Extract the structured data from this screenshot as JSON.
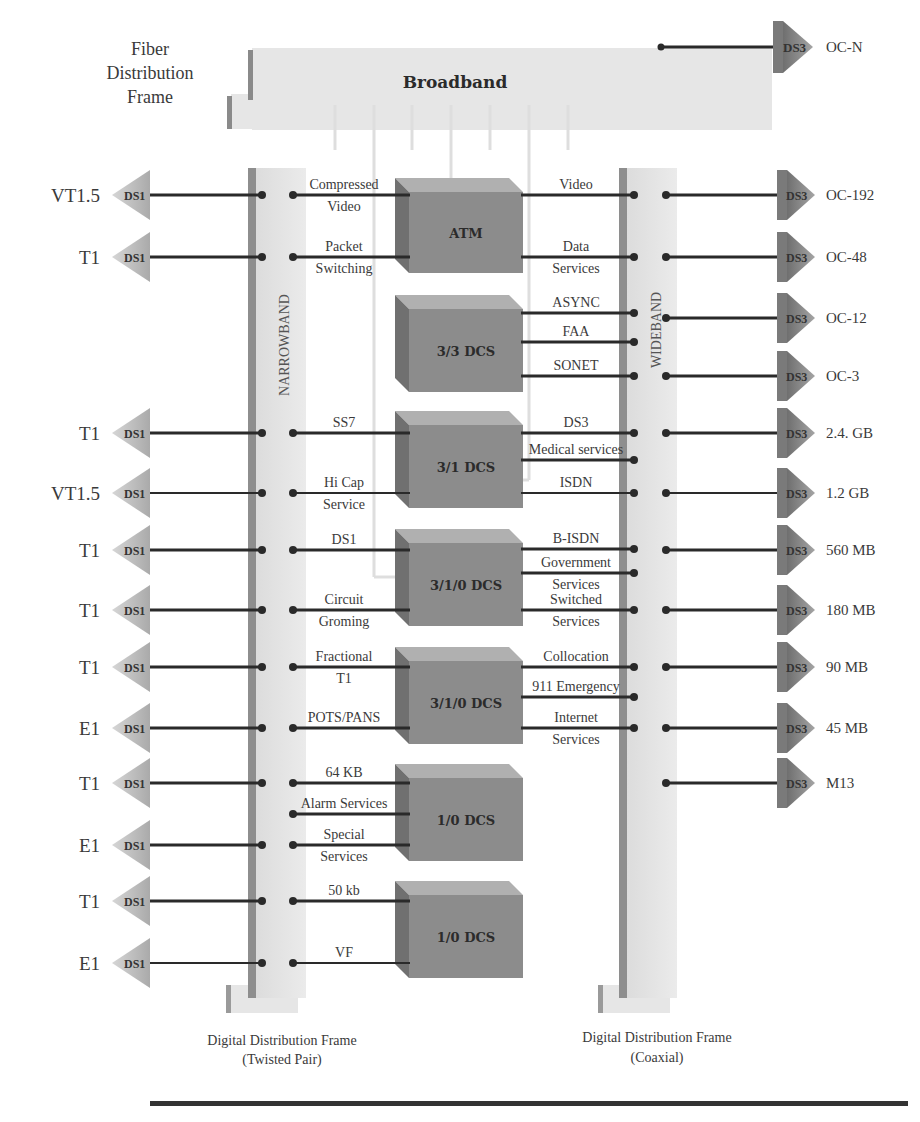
{
  "title_left": {
    "line1": "Fiber",
    "line2": "Distribution",
    "line3": "Frame"
  },
  "broadband": {
    "label": "Broadband",
    "output_tag": "DS3",
    "output_label": "OC-N"
  },
  "narrowband": {
    "label": "NARROWBAND"
  },
  "wideband": {
    "label": "WIDEBAND"
  },
  "frames": {
    "left_caption_1": "Digital Distribution Frame",
    "left_caption_2": "(Twisted Pair)",
    "right_caption_1": "Digital Distribution Frame",
    "right_caption_2": "(Coaxial)"
  },
  "left_ports": [
    {
      "label": "VT1.5",
      "tag": "DS1",
      "y": 195
    },
    {
      "label": "T1",
      "tag": "DS1",
      "y": 257
    },
    {
      "label": "T1",
      "tag": "DS1",
      "y": 433
    },
    {
      "label": "VT1.5",
      "tag": "DS1",
      "y": 493
    },
    {
      "label": "T1",
      "tag": "DS1",
      "y": 550
    },
    {
      "label": "T1",
      "tag": "DS1",
      "y": 610
    },
    {
      "label": "T1",
      "tag": "DS1",
      "y": 667
    },
    {
      "label": "E1",
      "tag": "DS1",
      "y": 728
    },
    {
      "label": "T1",
      "tag": "DS1",
      "y": 783
    },
    {
      "label": "E1",
      "tag": "DS1",
      "y": 845
    },
    {
      "label": "T1",
      "tag": "DS1",
      "y": 901
    },
    {
      "label": "E1",
      "tag": "DS1",
      "y": 963
    }
  ],
  "right_ports": [
    {
      "label": "OC-192",
      "tag": "DS3",
      "y": 195
    },
    {
      "label": "OC-48",
      "tag": "DS3",
      "y": 257
    },
    {
      "label": "OC-12",
      "tag": "DS3",
      "y": 318
    },
    {
      "label": "OC-3",
      "tag": "DS3",
      "y": 376
    },
    {
      "label": "2.4. GB",
      "tag": "DS3",
      "y": 433
    },
    {
      "label": "1.2 GB",
      "tag": "DS3",
      "y": 493
    },
    {
      "label": "560 MB",
      "tag": "DS3",
      "y": 550
    },
    {
      "label": "180 MB",
      "tag": "DS3",
      "y": 610
    },
    {
      "label": "90 MB",
      "tag": "DS3",
      "y": 667
    },
    {
      "label": "45 MB",
      "tag": "DS3",
      "y": 728
    },
    {
      "label": "M13",
      "tag": "DS3",
      "y": 783
    }
  ],
  "boxes": [
    {
      "label": "ATM",
      "x": 395,
      "y": 178,
      "w": 128,
      "h": 95
    },
    {
      "label": "3/3 DCS",
      "x": 395,
      "y": 295,
      "w": 128,
      "h": 97
    },
    {
      "label": "3/1 DCS",
      "x": 395,
      "y": 411,
      "w": 128,
      "h": 97
    },
    {
      "label": "3/1/0 DCS",
      "x": 395,
      "y": 529,
      "w": 128,
      "h": 97
    },
    {
      "label": "3/1/0 DCS",
      "x": 395,
      "y": 647,
      "w": 128,
      "h": 97
    },
    {
      "label": "1/0 DCS",
      "x": 395,
      "y": 764,
      "w": 128,
      "h": 97
    },
    {
      "label": "1/0 DCS",
      "x": 395,
      "y": 881,
      "w": 128,
      "h": 97
    }
  ],
  "left_services": [
    {
      "line1": "Compressed",
      "line2": "Video",
      "y": 195
    },
    {
      "line1": "Packet",
      "line2": "Switching",
      "y": 257
    },
    {
      "line1": "SS7",
      "line2": "",
      "y": 433
    },
    {
      "line1": "Hi Cap",
      "line2": "Service",
      "y": 493
    },
    {
      "line1": "DS1",
      "line2": "",
      "y": 550
    },
    {
      "line1": "Circuit",
      "line2": "Groming",
      "y": 610
    },
    {
      "line1": "Fractional",
      "line2": "T1",
      "y": 667
    },
    {
      "line1": "POTS/PANS",
      "line2": "",
      "y": 728
    },
    {
      "line1": "64 KB",
      "line2": "",
      "y": 783
    },
    {
      "line1": "Alarm Services",
      "line2": "",
      "y": 814
    },
    {
      "line1": "Special",
      "line2": "Services",
      "y": 845
    },
    {
      "line1": "50 kb",
      "line2": "",
      "y": 901
    },
    {
      "line1": "VF",
      "line2": "",
      "y": 963
    }
  ],
  "right_services": [
    {
      "line1": "Video",
      "line2": "",
      "y": 195
    },
    {
      "line1": "Data",
      "line2": "Services",
      "y": 257
    },
    {
      "line1": "ASYNC",
      "line2": "",
      "y": 313
    },
    {
      "line1": "FAA",
      "line2": "",
      "y": 342
    },
    {
      "line1": "SONET",
      "line2": "",
      "y": 376
    },
    {
      "line1": "DS3",
      "line2": "",
      "y": 433
    },
    {
      "line1": "Medical services",
      "line2": "",
      "y": 460
    },
    {
      "line1": "ISDN",
      "line2": "",
      "y": 493
    },
    {
      "line1": "B-ISDN",
      "line2": "",
      "y": 549
    },
    {
      "line1": "Government",
      "line2": "Services",
      "y": 573
    },
    {
      "line1": "Switched",
      "line2": "Services",
      "y": 610
    },
    {
      "line1": "Collocation",
      "line2": "",
      "y": 667
    },
    {
      "line1": "911 Emergency",
      "line2": "",
      "y": 697
    },
    {
      "line1": "Internet",
      "line2": "Services",
      "y": 728
    }
  ],
  "colors": {
    "frame_light": "#e4e4e4",
    "frame_dark": "#8a8a8a",
    "box_front": "#8c8c8c",
    "box_top": "#b0b0b0",
    "box_side": "#707070",
    "line": "#2a2a2a",
    "arrow_left": "#bdbdbd",
    "arrow_right": "#8e8e8e"
  }
}
